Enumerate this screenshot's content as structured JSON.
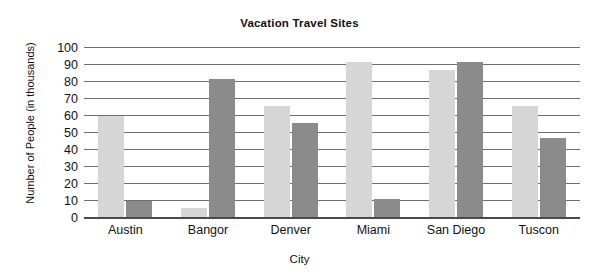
{
  "chart_data": {
    "type": "bar",
    "title": "Vacation Travel Sites",
    "xlabel": "City",
    "ylabel": "Number of People (in thousands)",
    "categories": [
      "Austin",
      "Bangor",
      "Denver",
      "Miami",
      "San Diego",
      "Tuscon"
    ],
    "series": [
      {
        "name": "Series 1",
        "color": "#d6d6d6",
        "values": [
          60,
          6,
          66,
          92,
          87,
          66
        ]
      },
      {
        "name": "Series 2",
        "color": "#8b8b8b",
        "values": [
          10,
          82,
          56,
          11,
          92,
          47
        ]
      }
    ],
    "ylim": [
      0,
      100
    ],
    "yticks": [
      0,
      10,
      20,
      30,
      40,
      50,
      60,
      70,
      80,
      90,
      100
    ],
    "ytick_labels": [
      "0",
      "10",
      "20",
      "30",
      "40",
      "50",
      "60",
      "70",
      "80",
      "90",
      "100"
    ],
    "grid": true,
    "legend": "none"
  }
}
